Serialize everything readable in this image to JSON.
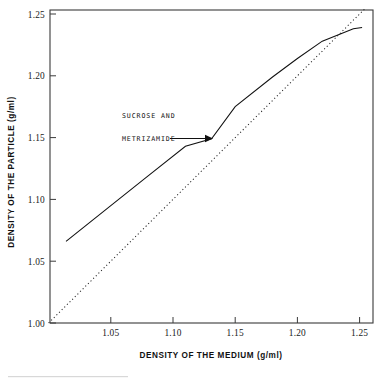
{
  "chart_data": {
    "type": "line",
    "title": "",
    "xlabel": "DENSITY OF THE MEDIUM (g/ml)",
    "ylabel": "DENSITY OF THE PARTICLE (g/ml)",
    "xlim": [
      1.0,
      1.26
    ],
    "ylim": [
      1.0,
      1.255
    ],
    "xticks": [
      1.05,
      1.1,
      1.15,
      1.2,
      1.25
    ],
    "xtick_labels": [
      "1.05",
      "1.10",
      "1.15",
      "1.20",
      "1.25"
    ],
    "yticks": [
      1.0,
      1.05,
      1.1,
      1.15,
      1.2,
      1.25
    ],
    "ytick_labels": [
      "1.00",
      "1.05",
      "1.10",
      "1.15",
      "1.20",
      "1.25"
    ],
    "grid": false,
    "legend": null,
    "series": [
      {
        "name": "SUCROSE AND METRIZAMIDE",
        "style": "solid",
        "color": "#111111",
        "x": [
          1.014,
          1.05,
          1.08,
          1.11,
          1.131,
          1.15,
          1.18,
          1.2,
          1.22,
          1.235,
          1.245,
          1.252
        ],
        "y": [
          1.066,
          1.095,
          1.119,
          1.143,
          1.149,
          1.175,
          1.199,
          1.214,
          1.228,
          1.234,
          1.238,
          1.239
        ]
      },
      {
        "name": "identity line",
        "style": "dotted",
        "color": "#222222",
        "x": [
          1.0,
          1.05,
          1.1,
          1.15,
          1.2,
          1.255
        ],
        "y": [
          1.0,
          1.05,
          1.1,
          1.15,
          1.2,
          1.255
        ]
      }
    ],
    "annotations": [
      {
        "name": "sucrose-metrizamide-label",
        "text_lines": [
          "SUCROSE AND",
          "METRIZAMIDE"
        ],
        "x": 1.062,
        "y": 1.165,
        "arrow_from": [
          1.097,
          1.15
        ],
        "arrow_to": [
          1.13,
          1.15
        ]
      }
    ]
  },
  "axes": {
    "x_title": "DENSITY OF THE MEDIUM (g/ml)",
    "y_title": "DENSITY OF THE PARTICLE (g/ml)",
    "x_tick_labels": [
      "1.05",
      "1.10",
      "1.15",
      "1.20",
      "1.25"
    ],
    "y_tick_labels": [
      "1.00",
      "1.05",
      "1.10",
      "1.15",
      "1.20",
      "1.25"
    ]
  },
  "annotation": {
    "line1": "SUCROSE AND",
    "line2": "METRIZAMIDE"
  },
  "colors": {
    "frame": "#3a3a3a",
    "curve": "#111111",
    "identity": "#222222",
    "background": "#ffffff"
  }
}
